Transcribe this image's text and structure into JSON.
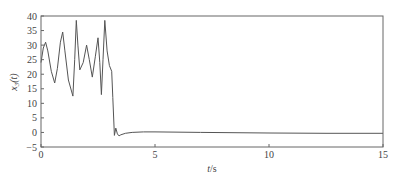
{
  "chart_data": {
    "type": "line",
    "title": "",
    "xlabel": "t/s",
    "ylabel": "x3(t)",
    "xlim": [
      0,
      15
    ],
    "ylim": [
      -5,
      40
    ],
    "xticks": [
      0,
      5,
      10,
      15
    ],
    "yticks": [
      -5,
      0,
      5,
      10,
      15,
      20,
      25,
      30,
      35,
      40
    ],
    "grid": false,
    "legend": null,
    "series": [
      {
        "name": "x3(t)",
        "color": "#555555",
        "x": [
          0,
          0.1,
          0.2,
          0.3,
          0.45,
          0.6,
          0.72,
          0.85,
          0.95,
          1.05,
          1.2,
          1.4,
          1.48,
          1.55,
          1.62,
          1.7,
          1.85,
          2.0,
          2.12,
          2.25,
          2.38,
          2.5,
          2.58,
          2.65,
          2.72,
          2.8,
          2.9,
          3.0,
          3.1,
          3.15,
          3.22,
          3.28,
          3.35,
          3.42,
          3.5,
          3.7,
          4.0,
          4.5,
          5,
          7,
          10,
          12.5,
          15
        ],
        "y": [
          24,
          29,
          31,
          28,
          21,
          17,
          22,
          31,
          34.5,
          28,
          18,
          12.5,
          25,
          38.5,
          30,
          21.5,
          24,
          30,
          25,
          19,
          26,
          32.5,
          24,
          13,
          25,
          38.5,
          28,
          23,
          21,
          12,
          -1,
          1.5,
          -0.5,
          -1.2,
          -0.8,
          -0.3,
          0,
          0.2,
          0.2,
          0,
          -0.2,
          -0.3,
          -0.3
        ]
      }
    ]
  },
  "labels": {
    "xlabel_italic": "t",
    "xlabel_unit": "/s",
    "ylabel_var": "x",
    "ylabel_sub": "3",
    "ylabel_arg": "(t)"
  }
}
